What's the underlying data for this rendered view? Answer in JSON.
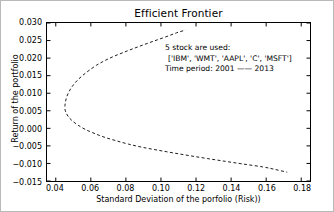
{
  "chart_data": {
    "type": "line",
    "title": "Efficient Frontier",
    "xlabel": "Standard Deviation of the porfolio (Risk))",
    "ylabel": "Return of the portfolio",
    "xlim": [
      0.035,
      0.185
    ],
    "ylim": [
      -0.015,
      0.03
    ],
    "grid": false,
    "legend": null,
    "linestyle": "dashed",
    "color": "#1a1a1a",
    "xticks": [
      "0.04",
      "0.06",
      "0.08",
      "0.10",
      "0.12",
      "0.14",
      "0.16",
      "0.18"
    ],
    "xtick_values": [
      0.04,
      0.06,
      0.08,
      0.1,
      0.12,
      0.14,
      0.16,
      0.18
    ],
    "yticks": [
      "-0.015",
      "-0.010",
      "-0.005",
      "0.000",
      "0.005",
      "0.010",
      "0.015",
      "0.020",
      "0.025",
      "0.030"
    ],
    "ytick_values": [
      -0.015,
      -0.01,
      -0.005,
      0.0,
      0.005,
      0.01,
      0.015,
      0.02,
      0.025,
      0.03
    ],
    "series": [
      {
        "name": "upper-branch",
        "x": [
          0.0452,
          0.0455,
          0.0463,
          0.0476,
          0.0495,
          0.052,
          0.0552,
          0.059,
          0.0633,
          0.068,
          0.0731,
          0.0785,
          0.0842,
          0.0901,
          0.0962,
          0.1025,
          0.1089,
          0.114
        ],
        "y": [
          0.0062,
          0.0075,
          0.009,
          0.0105,
          0.012,
          0.0135,
          0.015,
          0.0165,
          0.018,
          0.0193,
          0.0205,
          0.0216,
          0.0227,
          0.0238,
          0.0249,
          0.026,
          0.0272,
          0.028
        ]
      },
      {
        "name": "lower-branch",
        "x": [
          0.0452,
          0.0458,
          0.0472,
          0.0495,
          0.0527,
          0.0568,
          0.0618,
          0.0676,
          0.0742,
          0.0815,
          0.0894,
          0.098,
          0.107,
          0.1165,
          0.1264,
          0.1367,
          0.1473,
          0.1582,
          0.165,
          0.172
        ],
        "y": [
          0.0055,
          0.0045,
          0.0033,
          0.0021,
          0.0009,
          -0.0003,
          -0.0014,
          -0.0025,
          -0.0035,
          -0.0045,
          -0.0054,
          -0.0062,
          -0.007,
          -0.0078,
          -0.0086,
          -0.0094,
          -0.0102,
          -0.011,
          -0.0117,
          -0.0125
        ]
      }
    ],
    "annotations": {
      "line1": "5 stock are used:",
      "line2": "['IBM', 'WMT', 'AAPL', 'C', 'MSFT']",
      "line3": "Time period: 2001 —— 2013"
    }
  }
}
